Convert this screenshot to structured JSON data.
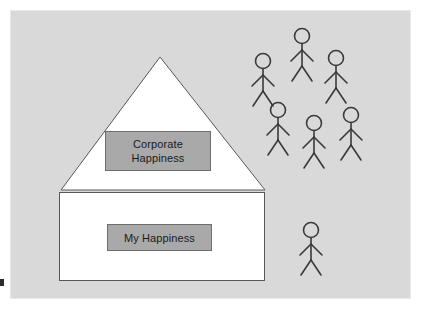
{
  "diagram": {
    "canvas": {
      "width": 421,
      "height": 309,
      "background_color": "#d9d9d9",
      "frame_color": "#e9e9e9"
    },
    "house": {
      "name": "house-outline",
      "fill_color": "#ffffff",
      "stroke_color": "#585858",
      "roof": {
        "apex_x": 160,
        "apex_y": 57,
        "left_x": 61,
        "right_x": 265,
        "base_y": 190
      },
      "body": {
        "x": 59,
        "y": 192,
        "width": 206,
        "height": 89
      }
    },
    "boxes": [
      {
        "name": "corporate-happiness-box",
        "label": "Corporate\nHappiness",
        "fill_color": "#a9a9a9",
        "stroke_color": "#6e6e6e",
        "text_color": "#1a1a1a"
      },
      {
        "name": "my-happiness-box",
        "label": "My Happiness",
        "fill_color": "#a9a9a9",
        "stroke_color": "#6e6e6e",
        "text_color": "#1a1a1a"
      }
    ],
    "people": {
      "stroke_color": "#3a3a3a",
      "group_label": "stick-figure-crowd",
      "count": 7,
      "figures": [
        {
          "name": "stick-figure-1",
          "head_x": 302,
          "head_y": 36,
          "scale": 1.0
        },
        {
          "name": "stick-figure-2",
          "head_x": 263,
          "head_y": 61,
          "scale": 1.0
        },
        {
          "name": "stick-figure-3",
          "head_x": 336,
          "head_y": 58,
          "scale": 1.0
        },
        {
          "name": "stick-figure-4",
          "head_x": 278,
          "head_y": 110,
          "scale": 1.0
        },
        {
          "name": "stick-figure-5",
          "head_x": 314,
          "head_y": 123,
          "scale": 1.0
        },
        {
          "name": "stick-figure-6",
          "head_x": 351,
          "head_y": 115,
          "scale": 1.0
        },
        {
          "name": "stick-figure-7",
          "head_x": 311,
          "head_y": 230,
          "scale": 1.0
        }
      ]
    }
  }
}
